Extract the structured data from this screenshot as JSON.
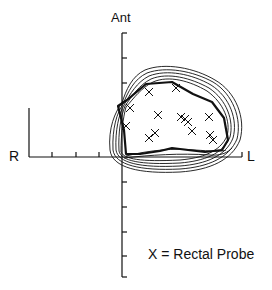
{
  "figure": {
    "labels": {
      "anterior": "Ant",
      "right": "R",
      "left": "L"
    },
    "legend": {
      "text": "X = Rectal Probe",
      "marker": "X",
      "meaning": "Rectal Probe"
    },
    "axes": {
      "vertical": {
        "x": 122,
        "y_top": 33,
        "y_bottom": 277,
        "ticks_y": [
          33,
          58,
          83,
          107,
          132,
          182,
          207,
          232,
          256,
          277
        ]
      },
      "horizontal": {
        "y": 157,
        "x_left": 29,
        "x_right": 242,
        "ticks_x": [
          52,
          76,
          99,
          147,
          171,
          194,
          218,
          242
        ]
      },
      "left_vertical_bar": {
        "x": 29,
        "y_top": 108,
        "y_bottom": 157
      }
    },
    "markers": [
      {
        "x": 149,
        "y": 92
      },
      {
        "x": 176,
        "y": 88
      },
      {
        "x": 130,
        "y": 108
      },
      {
        "x": 158,
        "y": 115
      },
      {
        "x": 181,
        "y": 117
      },
      {
        "x": 185,
        "y": 119
      },
      {
        "x": 188,
        "y": 122
      },
      {
        "x": 209,
        "y": 117
      },
      {
        "x": 126,
        "y": 126
      },
      {
        "x": 192,
        "y": 131
      },
      {
        "x": 149,
        "y": 138
      },
      {
        "x": 155,
        "y": 133
      },
      {
        "x": 210,
        "y": 135
      },
      {
        "x": 213,
        "y": 140
      }
    ],
    "colors": {
      "ink": "#111111",
      "background": "#ffffff"
    }
  }
}
